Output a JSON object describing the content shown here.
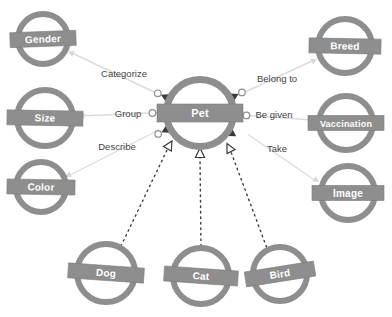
{
  "diagram": {
    "colors": {
      "background": "#ffffff",
      "node_gray": "#8e8e8e",
      "band_border": "#7c7c7c",
      "node_text": "#ffffff",
      "assoc_line": "#dcdcdc",
      "assoc_arrow": "#d6d6d6",
      "dark_line": "#3a3a3a",
      "marker_ring": "#8e8e8e",
      "edge_label": "#3f3f3f"
    },
    "nodes": {
      "pet": {
        "label": "Pet"
      },
      "gender": {
        "label": "Gender"
      },
      "size": {
        "label": "Size"
      },
      "color": {
        "label": "Color"
      },
      "breed": {
        "label": "Breed"
      },
      "vaccination": {
        "label": "Vaccination"
      },
      "image": {
        "label": "Image"
      },
      "dog": {
        "label": "Dog"
      },
      "cat": {
        "label": "Cat"
      },
      "bird": {
        "label": "Bird"
      }
    },
    "edges": {
      "categorize": {
        "label": "Categorize",
        "from": "Pet",
        "to": "Gender",
        "type": "association"
      },
      "group": {
        "label": "Group",
        "from": "Pet",
        "to": "Size",
        "type": "association"
      },
      "describe": {
        "label": "Describe",
        "from": "Pet",
        "to": "Color",
        "type": "association"
      },
      "belong_to": {
        "label": "Belong to",
        "from": "Pet",
        "to": "Breed",
        "type": "association"
      },
      "be_given": {
        "label": "Be given",
        "from": "Pet",
        "to": "Vaccination",
        "type": "association"
      },
      "take": {
        "label": "Take",
        "from": "Pet",
        "to": "Image",
        "type": "association"
      },
      "dog_is_a": {
        "label": "",
        "from": "Dog",
        "to": "Pet",
        "type": "generalization-dashed"
      },
      "cat_is_a": {
        "label": "",
        "from": "Cat",
        "to": "Pet",
        "type": "generalization-dashed"
      },
      "bird_is_a": {
        "label": "",
        "from": "Bird",
        "to": "Pet",
        "type": "generalization-dashed"
      }
    }
  }
}
